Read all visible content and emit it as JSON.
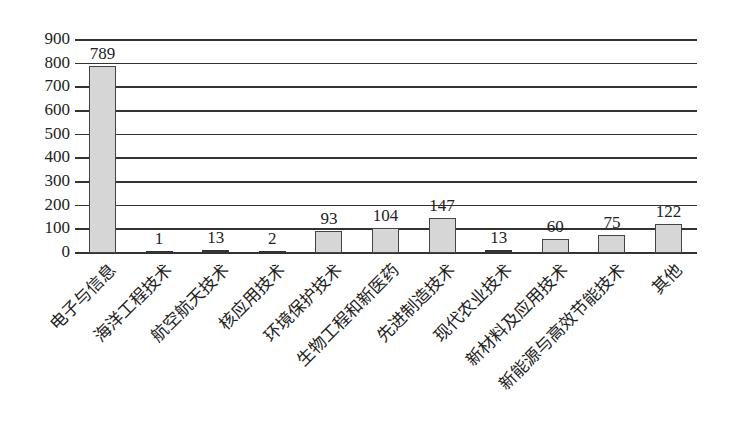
{
  "chart_data": {
    "type": "bar",
    "title": "",
    "xlabel": "",
    "ylabel": "",
    "ylim": [
      0,
      900
    ],
    "yticks": [
      0,
      100,
      200,
      300,
      400,
      500,
      600,
      700,
      800,
      900
    ],
    "grid": true,
    "legend": null,
    "categories": [
      "电子与信息",
      "海洋工程技术",
      "航空航天技术",
      "核应用技术",
      "环境保护技术",
      "生物工程和新医药",
      "先进制造技术",
      "现代农业技术",
      "新材料及应用技术",
      "新能源与高效节能技术",
      "其他"
    ],
    "values": [
      789,
      1,
      13,
      2,
      93,
      104,
      147,
      13,
      60,
      75,
      122
    ],
    "value_labels": [
      "789",
      "1",
      "13",
      "2",
      "93",
      "104",
      "147",
      "13",
      "60",
      "75",
      "122"
    ]
  },
  "colors": {
    "bar_fill": "#d6d6d6",
    "bar_border": "#444444",
    "gridline": "#333333"
  }
}
